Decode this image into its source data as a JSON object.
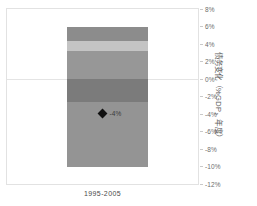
{
  "chart_data": {
    "type": "bar",
    "title": "",
    "subtitle": "",
    "xlabel": "",
    "ylabel": "债务变化（%GDP，年度）",
    "categories": [
      "1995-2005"
    ],
    "ylim": [
      -12,
      8
    ],
    "ytick_labels": [
      "8%",
      "6%",
      "4%",
      "2%",
      "0%",
      "-2%",
      "-4%",
      "-6%",
      "-8%",
      "-10%",
      "-12%"
    ],
    "ytick_values": [
      8,
      6,
      4,
      2,
      0,
      -2,
      -4,
      -6,
      -8,
      -10,
      -12
    ],
    "grid": "zero-line-only",
    "legend": "none",
    "stacked": true,
    "series": [
      {
        "name": "segment-1",
        "from": 6.0,
        "to": 4.3,
        "color": "#8c8c8c"
      },
      {
        "name": "segment-2",
        "from": 4.3,
        "to": 3.2,
        "color": "#c4c4c4"
      },
      {
        "name": "segment-3",
        "from": 3.2,
        "to": 0.0,
        "color": "#979797"
      },
      {
        "name": "segment-4",
        "from": 0.0,
        "to": -2.6,
        "color": "#7b7b7b"
      },
      {
        "name": "segment-5",
        "from": -2.6,
        "to": -10.0,
        "color": "#949494"
      }
    ],
    "markers": [
      {
        "name": "net-change",
        "value": -4,
        "label": "-4%",
        "shape": "diamond",
        "color": "#111111"
      }
    ],
    "bar": {
      "left_pct": 31.6,
      "width_pct": 42.0
    },
    "colors": {
      "frame": "#e2e2e2",
      "zero_line": "#e4e4e4",
      "tick_text": "#6d6d6d",
      "axis_title": "#5d5d5d",
      "category_text": "#4a4a4a",
      "marker": "#111111"
    }
  }
}
